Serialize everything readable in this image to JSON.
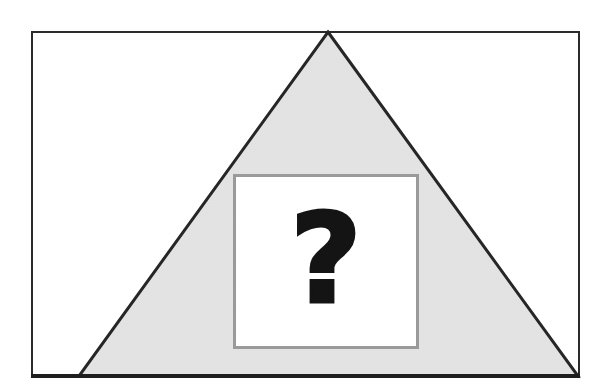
{
  "figure": {
    "kind": "scanned-diagram",
    "background_color": "#ffffff",
    "frame": {
      "name": "outer-rectangle",
      "border_color": "#2b2b2b",
      "fill_color": "#ffffff",
      "x": 31,
      "y": 31,
      "width": 549,
      "height": 347,
      "border_width": 2
    },
    "triangle": {
      "name": "gray-triangle",
      "fill_color": "#e3e3e3",
      "stroke_color": "#262626",
      "stroke_width": 3,
      "apex": {
        "x": 328,
        "y": 32
      },
      "left_vertex": {
        "x": 79,
        "y": 376
      },
      "right_vertex": {
        "x": 578,
        "y": 376
      }
    },
    "inner_square": {
      "name": "inner-square",
      "fill_color": "#ffffff",
      "border_color": "#9a9a9a",
      "border_width": 3,
      "x": 233,
      "y": 174,
      "width": 186,
      "height": 175
    },
    "symbol": {
      "name": "question-mark",
      "glyph": "?",
      "color": "#141414",
      "weight": "bold",
      "center": {
        "x": 326,
        "y": 262
      }
    }
  }
}
